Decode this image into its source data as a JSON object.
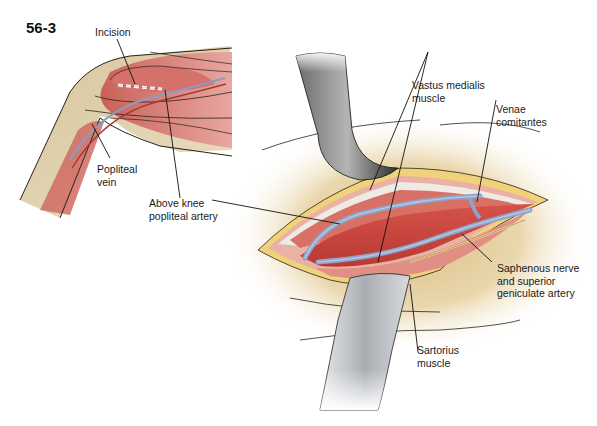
{
  "figure": {
    "number": "56-3",
    "type": "surgical anatomy illustration",
    "colors": {
      "muscle": "#c8463e",
      "muscle_light": "#e3928a",
      "vein": "#8ea4c8",
      "skin": "#e6d2a8",
      "fat": "#f0d27a",
      "retractor_dark": "#3a3a3a",
      "retractor_light": "#b9bcc0"
    }
  },
  "labels": {
    "incision": "Incision",
    "popliteal_vein": "Popliteal\nvein",
    "above_knee_artery": "Above knee\npopliteal artery",
    "vastus_medialis": "Vastus medialis\nmuscle",
    "venae_comitantes": "Venae\ncomitantes",
    "saphenous_nerve": "Saphenous nerve\nand superior\ngeniculate artery",
    "sartorius": "Sartorius\nmuscle"
  },
  "panels": [
    {
      "name": "inset",
      "description": "Bent knee, medial view, with incision line"
    },
    {
      "name": "main",
      "description": "Operative field with two retractors exposing above-knee popliteal artery"
    }
  ]
}
